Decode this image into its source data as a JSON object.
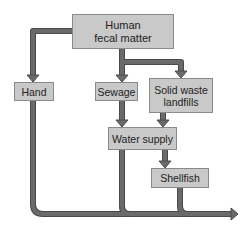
{
  "diagram": {
    "type": "flowchart",
    "colors": {
      "box_fill": "#c9c9c9",
      "box_border": "#8a8a8a",
      "arrow": "#666666",
      "arrow_outline": "#4a4a4a"
    },
    "nodes": [
      {
        "id": "human",
        "label_line1": "Human",
        "label_line2": "fecal matter"
      },
      {
        "id": "hand",
        "label": "Hand"
      },
      {
        "id": "sewage",
        "label": "Sewage"
      },
      {
        "id": "solid",
        "label_line1": "Solid waste",
        "label_line2": "landfills"
      },
      {
        "id": "water",
        "label": "Water supply"
      },
      {
        "id": "shellfish",
        "label": "Shellfish"
      }
    ],
    "edges": [
      {
        "from": "human",
        "to": "hand"
      },
      {
        "from": "human",
        "to": "sewage"
      },
      {
        "from": "human",
        "to": "solid"
      },
      {
        "from": "sewage",
        "to": "water"
      },
      {
        "from": "solid",
        "to": "water"
      },
      {
        "from": "water",
        "to": "shellfish"
      },
      {
        "from": "hand",
        "to": "output"
      },
      {
        "from": "water",
        "to": "output"
      },
      {
        "from": "shellfish",
        "to": "output"
      }
    ]
  }
}
